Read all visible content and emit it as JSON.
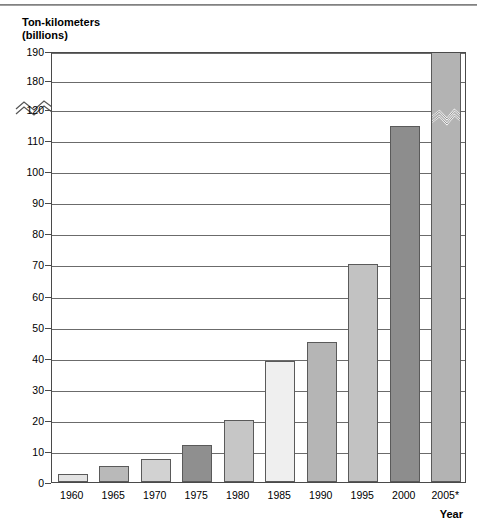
{
  "chart_data": {
    "type": "bar",
    "title": "",
    "ylabel": "Ton-kilometers\n(billions)",
    "ylabel_line1": "Ton-kilometers",
    "ylabel_line2": "(billions)",
    "xlabel": "Year",
    "categories": [
      "1960",
      "1965",
      "1970",
      "1975",
      "1980",
      "1985",
      "1990",
      "1995",
      "2000",
      "2005*"
    ],
    "values": [
      2.5,
      5,
      7.5,
      12,
      20,
      39,
      45,
      70,
      114.5,
      190
    ],
    "ytick_labels": [
      "0",
      "10",
      "20",
      "30",
      "40",
      "50",
      "60",
      "70",
      "80",
      "90",
      "100",
      "110",
      "120",
      "180",
      "190"
    ],
    "ytick_values": [
      0,
      10,
      20,
      30,
      40,
      50,
      60,
      70,
      80,
      90,
      100,
      110,
      120,
      180,
      190
    ],
    "ylim": [
      0,
      190
    ],
    "axis_break": {
      "below": 120,
      "above": 180,
      "label": "axis-break-zigzag"
    },
    "grid": true,
    "legend": "none",
    "bar_colors": [
      "#e3e3e3",
      "#b9b9b9",
      "#d2d2d2",
      "#8f8f8f",
      "#c6c6c6",
      "#efefef",
      "#b5b5b5",
      "#c2c2c2",
      "#8d8d8d",
      "#b3b3b3"
    ],
    "annotations": [
      "* value for 2005 is preliminary/estimated (denoted by asterisk)"
    ],
    "colors": {
      "axis": "#4a4a4a",
      "gridline": "#6b6b6b",
      "shadow": "#b9b9b9",
      "background": "#ffffff",
      "text": "#000000"
    }
  }
}
